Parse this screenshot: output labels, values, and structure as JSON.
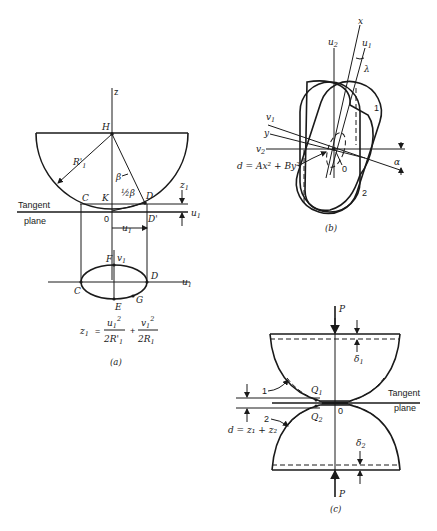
{
  "figure_a": {
    "caption": "(a)",
    "axis_z": "z",
    "point_H": "H",
    "radius_label": "R'",
    "radius_sub": "1",
    "angle_beta": "β",
    "angle_half_beta": "½β",
    "point_C": "C",
    "point_K": "K",
    "point_D": "D",
    "point_D_prime": "D'",
    "origin": "0",
    "tangent_label_1": "Tangent",
    "tangent_label_2": "plane",
    "z1_label": "z",
    "z1_sub": "1",
    "u1_label": "u",
    "u1_sub": "1",
    "ellipse": {
      "point_F": "F",
      "point_C": "C",
      "point_D": "D",
      "point_E": "E",
      "point_G": "G",
      "axis_v": "v",
      "axis_v_sub": "1",
      "axis_u": "u",
      "axis_u_sub": "1"
    },
    "formula": {
      "lhs": "z",
      "lhs_sub": "1",
      "eq": "=",
      "num1": "u",
      "num1_sub": "1",
      "num1_sup": "2",
      "den1": "2R'",
      "den1_sub": "1",
      "plus": "+",
      "num2": "v",
      "num2_sub": "1",
      "num2_sup": "2",
      "den2": "2R",
      "den2_sub": "1"
    }
  },
  "figure_b": {
    "caption": "(b)",
    "axis_x": "x",
    "axis_u2": "u",
    "axis_u2_sub": "2",
    "axis_u1": "u",
    "axis_u1_sub": "1",
    "angle_lambda": "λ",
    "axis_v1": "v",
    "axis_v1_sub": "1",
    "axis_y": "y",
    "axis_v2": "v",
    "axis_v2_sub": "2",
    "angle_alpha": "α",
    "origin": "0",
    "body_1": "1",
    "body_2": "2",
    "equation": "d = Ax² + By²"
  },
  "figure_c": {
    "caption": "(c)",
    "load_top": "P",
    "load_bottom": "P",
    "delta1": "δ",
    "delta1_sub": "1",
    "delta2": "δ",
    "delta2_sub": "2",
    "body_1": "1",
    "body_2": "2",
    "point_Q1": "Q",
    "point_Q1_sub": "1",
    "point_Q2": "Q",
    "point_Q2_sub": "2",
    "origin": "0",
    "tangent_label_1": "Tangent",
    "tangent_label_2": "plane",
    "gap_equation": "d = z₁ + z₂"
  }
}
